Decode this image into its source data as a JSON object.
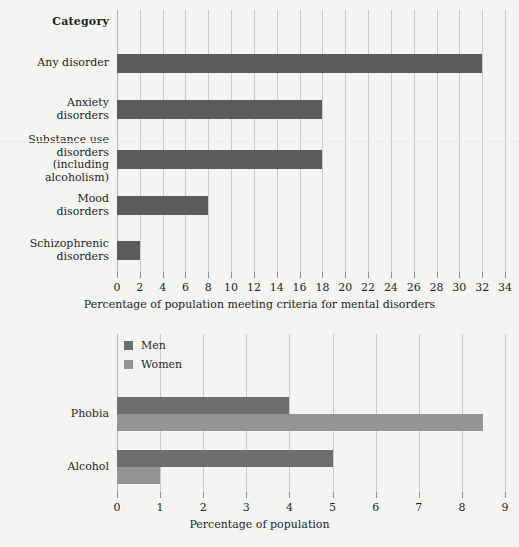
{
  "page": {
    "background_color": "#f4f4f2",
    "bar_color_primary": "#5b5b5b",
    "bar_color_secondary": "#8c8c8c",
    "gridline_color": "#c9c9c9",
    "text_color": "#1f1f1f"
  },
  "chart_data": [
    {
      "id": "top",
      "type": "bar",
      "orientation": "horizontal",
      "title": "",
      "xlabel": "Percentage of population meeting criteria for mental disorders",
      "ylabel": "Category",
      "category_header": "Category",
      "xlim": [
        0,
        34
      ],
      "xticks": [
        0,
        2,
        4,
        6,
        8,
        10,
        12,
        14,
        16,
        18,
        20,
        22,
        24,
        26,
        28,
        30,
        32,
        34
      ],
      "xtick_labels": [
        "0",
        "2",
        "4",
        "6",
        "8",
        "10",
        "12",
        "14",
        "16",
        "18",
        "20",
        "22",
        "24",
        "26",
        "28",
        "30",
        "32",
        "34"
      ],
      "grid": true,
      "legend": false,
      "categories": [
        "Any disorder",
        "Anxiety\ndisorders",
        "Substance use\ndisorders\n(including\nalcoholism)",
        "Mood\ndisorders",
        "Schizophrenic\ndisorders"
      ],
      "values": [
        32,
        18,
        18,
        8,
        2
      ],
      "series": [
        {
          "name": "Percentage of population",
          "color": "#5b5b5b",
          "values": [
            32,
            18,
            18,
            8,
            2
          ]
        }
      ]
    },
    {
      "id": "bottom",
      "type": "bar",
      "orientation": "horizontal",
      "title": "",
      "xlabel": "Percentage of population",
      "ylabel": "",
      "xlim": [
        0,
        9
      ],
      "xticks": [
        0,
        1,
        2,
        3,
        4,
        5,
        6,
        7,
        8,
        9
      ],
      "xtick_labels": [
        "0",
        "1",
        "2",
        "3",
        "4",
        "5",
        "6",
        "7",
        "8",
        "9"
      ],
      "grid": true,
      "legend": true,
      "legend_position": "top-left",
      "categories": [
        "Phobia",
        "Alcohol"
      ],
      "series": [
        {
          "name": "Men",
          "color": "#6e6e6e",
          "values": [
            4,
            5
          ]
        },
        {
          "name": "Women",
          "color": "#949494",
          "values": [
            8.5,
            1
          ]
        }
      ]
    }
  ]
}
